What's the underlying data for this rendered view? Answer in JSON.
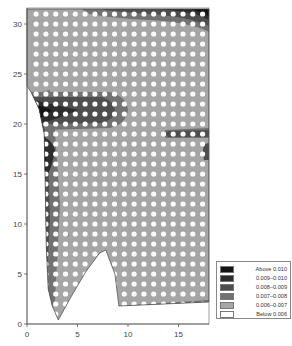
{
  "chart_data": {
    "type": "heatmap",
    "subtype": "filled-contour",
    "title": "",
    "xlabel": "",
    "ylabel": "",
    "xlim": [
      0,
      18
    ],
    "ylim": [
      0,
      31.5
    ],
    "x_ticks": [
      0,
      5,
      10,
      15
    ],
    "y_ticks": [
      0,
      5,
      10,
      15,
      20,
      25,
      30
    ],
    "grid": false,
    "legend_position": "lower right, outside plot",
    "legend": [
      {
        "label": "Above 0.010",
        "color": "#141414"
      },
      {
        "label": "0.009–0.010",
        "color": "#2e2e2e"
      },
      {
        "label": "0.008–0.009",
        "color": "#4e4e4e"
      },
      {
        "label": "0.007–0.008",
        "color": "#727272"
      },
      {
        "label": "0.006–0.007",
        "color": "#a6a6a6"
      },
      {
        "label": "Below 0.006",
        "color": "#ffffff"
      }
    ],
    "domain_outline": [
      [
        1.9,
        31.5
      ],
      [
        18,
        31.5
      ],
      [
        18,
        2.2
      ],
      [
        9.1,
        1.8
      ],
      [
        8.7,
        5
      ],
      [
        7.8,
        7.4
      ],
      [
        7.2,
        7.1
      ],
      [
        5.8,
        5.2
      ],
      [
        4.3,
        2.6
      ],
      [
        3.1,
        0.4
      ],
      [
        2.5,
        1.8
      ],
      [
        2.1,
        3.5
      ],
      [
        1.9,
        8
      ],
      [
        1.8,
        14
      ],
      [
        1.7,
        19
      ],
      [
        1.2,
        21.5
      ],
      [
        0.4,
        23.2
      ],
      [
        0,
        23.8
      ],
      [
        0,
        31.5
      ]
    ],
    "dominant_level": "0.006–0.007",
    "regions": [
      {
        "level": "Above 0.010",
        "description": "left edge near y=21 and top-right corner near x=17.5,y=31"
      },
      {
        "level": "0.009–0.010",
        "description": "band at y≈20–22.5 from x≈0.5 to x≈6; left edge y≈14–18"
      },
      {
        "level": "0.008–0.009",
        "description": "band at y≈18.5–19.5 from x≈13.5 to 18; tongue around x≈17.5, y≈16.5–17.5"
      },
      {
        "level": "0.007–0.008",
        "description": "surrounding halo near left edge and top edge"
      }
    ],
    "overlay": {
      "type": "dot-grid",
      "description": "white dots marking holes/nodes at ~1 unit spacing",
      "x_start": 0.9,
      "x_step": 0.97,
      "y_start": 1,
      "y_step": 1
    }
  }
}
